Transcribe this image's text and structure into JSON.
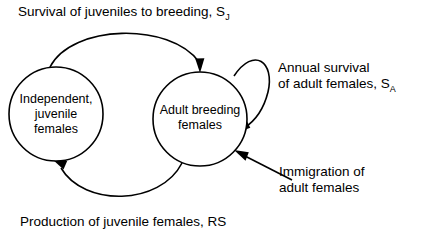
{
  "diagram": {
    "background_color": "#ffffff",
    "stroke_color": "#000000",
    "nodes": [
      {
        "id": "juvenile",
        "name": "independent-juvenile-females-node",
        "lines": [
          "Independent,",
          "juvenile",
          "females"
        ],
        "cx": 56,
        "cy": 114,
        "r": 47
      },
      {
        "id": "adult",
        "name": "adult-breeding-females-node",
        "lines": [
          "Adult breeding",
          "females"
        ],
        "cx": 200,
        "cy": 119,
        "r": 47
      }
    ],
    "labels": {
      "top_arc": {
        "text": "Survival of juveniles to breeding, S",
        "subscript": "J"
      },
      "bottom_arc": {
        "text": "Production of juvenile females, RS",
        "subscript": ""
      },
      "self_loop": {
        "line1": "Annual survival",
        "line2": "of adult females, S",
        "subscript": "A"
      },
      "immigration": {
        "line1": "Immigration of",
        "line2": "adult females"
      }
    },
    "edges": [
      {
        "name": "arrow-juvenile-to-adult",
        "from": "juvenile",
        "to": "adult",
        "style": "arc-over-top"
      },
      {
        "name": "arrow-adult-to-juvenile",
        "from": "adult",
        "to": "juvenile",
        "style": "arc-under-bottom"
      },
      {
        "name": "arrow-adult-self-loop",
        "from": "adult",
        "to": "adult",
        "style": "self-loop-right"
      },
      {
        "name": "arrow-immigration-into-adult",
        "from": "external",
        "to": "adult",
        "style": "straight"
      }
    ]
  }
}
